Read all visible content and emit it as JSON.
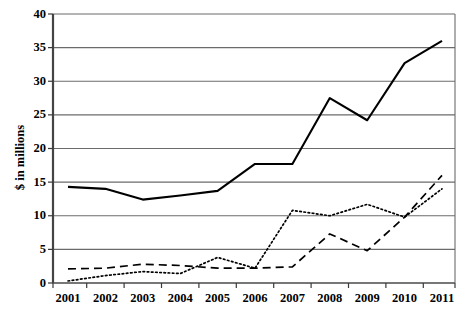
{
  "chart_data": {
    "type": "line",
    "title": "",
    "xlabel": "",
    "ylabel": "$ in millions",
    "categories": [
      "2001",
      "2002",
      "2003",
      "2004",
      "2005",
      "2006",
      "2007",
      "2008",
      "2009",
      "2010",
      "2011"
    ],
    "ylim": [
      0,
      40
    ],
    "yticks": [
      0,
      5,
      10,
      15,
      20,
      25,
      30,
      35,
      40
    ],
    "ytick_labels": [
      "0",
      "5",
      "10",
      "15",
      "20",
      "25",
      "30",
      "35",
      "40"
    ],
    "grid": "horizontal",
    "legend": "none",
    "series": [
      {
        "name": "solid-series",
        "style": "solid",
        "color": "#000000",
        "width": 2.1,
        "values": [
          14.3,
          14.0,
          12.4,
          13.0,
          13.7,
          17.7,
          17.7,
          27.5,
          24.2,
          32.7,
          36.0
        ]
      },
      {
        "name": "dashed-series",
        "style": "dashed",
        "color": "#000000",
        "width": 1.7,
        "values": [
          2.1,
          2.2,
          2.8,
          2.6,
          2.2,
          2.2,
          2.4,
          7.3,
          4.8,
          9.8,
          16.0
        ]
      },
      {
        "name": "dotted-series",
        "style": "dotted",
        "color": "#000000",
        "width": 1.7,
        "values": [
          0.3,
          1.1,
          1.7,
          1.4,
          3.8,
          2.2,
          10.8,
          10.0,
          11.7,
          9.8,
          14.0
        ]
      }
    ]
  },
  "axis": {
    "ylabel_text": "$ in millions"
  }
}
